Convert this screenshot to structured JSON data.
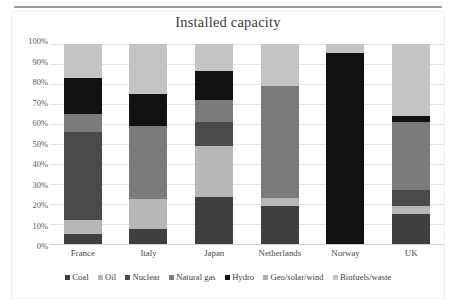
{
  "chart_data": {
    "type": "bar",
    "subtype": "stacked-100-percent",
    "title": "Installed capacity",
    "xlabel": "",
    "ylabel": "",
    "ylim": [
      0,
      100
    ],
    "ytick_labels": [
      "100%",
      "90%",
      "80%",
      "70%",
      "60%",
      "50%",
      "40%",
      "30%",
      "20%",
      "10%",
      "0%"
    ],
    "ytick_values": [
      100,
      90,
      80,
      70,
      60,
      50,
      40,
      30,
      20,
      10,
      0
    ],
    "grid": true,
    "legend_position": "bottom",
    "categories": [
      "France",
      "Italy",
      "Japan",
      "Netherlands",
      "Norway",
      "UK"
    ],
    "series": [
      {
        "name": "Coal",
        "color": "#3f3f3f",
        "values": [
          5.0,
          7.5,
          23.5,
          19.0,
          0.0,
          15.0
        ]
      },
      {
        "name": "Oil",
        "color": "#b7b7b7",
        "values": [
          7.0,
          15.0,
          25.5,
          4.0,
          0.0,
          4.0
        ]
      },
      {
        "name": "Nuclear",
        "color": "#4a4a4a",
        "values": [
          44.0,
          0.0,
          12.0,
          0.0,
          0.0,
          8.0
        ]
      },
      {
        "name": "Natural gas",
        "color": "#7b7b7b",
        "values": [
          9.0,
          36.5,
          11.0,
          56.0,
          0.0,
          34.0
        ]
      },
      {
        "name": "Hydro",
        "color": "#111111",
        "values": [
          18.0,
          16.0,
          14.5,
          0.0,
          95.5,
          3.0
        ]
      },
      {
        "name": "Geo/solar/wind",
        "color": "#adadad",
        "values": [
          0.0,
          0.0,
          0.0,
          0.0,
          0.0,
          0.0
        ]
      },
      {
        "name": "Biofuels/waste",
        "color": "#c4c4c4",
        "values": [
          17.0,
          25.0,
          13.5,
          21.0,
          4.5,
          36.0
        ]
      }
    ]
  },
  "legend": {
    "items": [
      {
        "label": "Coal",
        "color": "#3f3f3f",
        "icon": "square-swatch-icon"
      },
      {
        "label": "Oil",
        "color": "#b7b7b7",
        "icon": "square-swatch-icon"
      },
      {
        "label": "Nuclear",
        "color": "#4a4a4a",
        "icon": "square-swatch-icon"
      },
      {
        "label": "Natural gas",
        "color": "#7b7b7b",
        "icon": "square-swatch-icon"
      },
      {
        "label": "Hydro",
        "color": "#111111",
        "icon": "square-swatch-icon"
      },
      {
        "label": "Geo/solar/wind",
        "color": "#adadad",
        "icon": "square-swatch-icon"
      },
      {
        "label": "Biofuels/waste",
        "color": "#c4c4c4",
        "icon": "square-swatch-icon"
      }
    ]
  },
  "style": {
    "background": "#ffffff",
    "gridline_color": "#e4e4e4",
    "axis_color": "#cfcfcf",
    "text_color": "#3c3c3c",
    "rule_color": "#9a9a9a"
  }
}
